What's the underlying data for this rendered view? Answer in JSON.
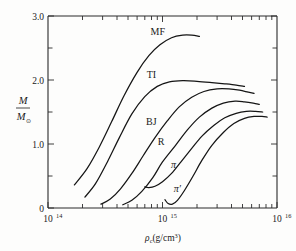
{
  "figure": {
    "name": "neutron-star-mass-vs-central-density",
    "background": "#fdfdfc",
    "ink": "#151515"
  },
  "axes": {
    "y": {
      "label_numerator": "M",
      "label_denominator": "M",
      "label_denominator_sub": "⊙",
      "label_plain": "M/M⊙",
      "major_ticks": [
        "3.0",
        "2.0",
        "1.0",
        "0"
      ],
      "major_values": [
        3.0,
        2.0,
        1.0,
        0.0
      ],
      "minor_values": [
        2.5,
        1.5,
        0.5
      ],
      "min": 0.0,
      "max": 3.0
    },
    "x": {
      "label": "ρc(g/cm3)",
      "label_base": "ρ",
      "label_sub": "c",
      "label_units_open": "(g/cm",
      "label_units_exp": "3",
      "label_units_close": ")",
      "tick_labels": [
        "10",
        "10",
        "10"
      ],
      "tick_exponents": [
        "14",
        "15",
        "16"
      ],
      "tick_values": [
        100000000000000.0,
        1000000000000000.0,
        1e+16
      ],
      "scale": "log",
      "min": 100000000000000.0,
      "max": 1e+16
    }
  },
  "curves": [
    {
      "name": "MF",
      "label": "MF"
    },
    {
      "name": "TI",
      "label": "TI"
    },
    {
      "name": "BJ",
      "label": "BJ"
    },
    {
      "name": "R",
      "label": "R"
    },
    {
      "name": "pi",
      "label": "π"
    },
    {
      "name": "pi-prime",
      "label": "π′"
    }
  ],
  "chart_data": {
    "type": "line",
    "title": "",
    "xlabel": "ρc(g/cm3)",
    "ylabel": "M/M⊙",
    "xscale": "log",
    "xlim": [
      100000000000000.0,
      1e+16
    ],
    "ylim": [
      0,
      3.0
    ],
    "grid": false,
    "legend": "inline-curve-labels",
    "yticks": [
      0,
      1.0,
      2.0,
      3.0
    ],
    "yticks_minor": [
      0.5,
      1.5,
      2.5
    ],
    "xticks": [
      100000000000000.0,
      1000000000000000.0,
      1e+16
    ],
    "series": [
      {
        "name": "MF",
        "label": "MF",
        "label_x": 910000000000000.0,
        "label_y": 2.7,
        "x": [
          170000000000000.0,
          220000000000000.0,
          280000000000000.0,
          360000000000000.0,
          460000000000000.0,
          600000000000000.0,
          760000000000000.0,
          950000000000000.0,
          1200000000000000.0,
          1500000000000000.0,
          1800000000000000.0,
          2100000000000000.0
        ],
        "y": [
          0.36,
          0.62,
          0.95,
          1.35,
          1.75,
          2.12,
          2.38,
          2.55,
          2.66,
          2.7,
          2.7,
          2.68
        ]
      },
      {
        "name": "TI",
        "label": "TI",
        "label_x": 800000000000000.0,
        "label_y": 2.03,
        "x": [
          210000000000000.0,
          260000000000000.0,
          330000000000000.0,
          420000000000000.0,
          540000000000000.0,
          700000000000000.0,
          900000000000000.0,
          1150000000000000.0,
          1500000000000000.0,
          2000000000000000.0,
          2700000000000000.0,
          3500000000000000.0,
          4400000000000000.0,
          5200000000000000.0
        ],
        "y": [
          0.17,
          0.38,
          0.72,
          1.1,
          1.47,
          1.74,
          1.9,
          1.97,
          1.99,
          1.98,
          1.96,
          1.94,
          1.92,
          1.9
        ]
      },
      {
        "name": "BJ",
        "label": "BJ",
        "label_x": 800000000000000.0,
        "label_y": 1.3,
        "x": [
          290000000000000.0,
          350000000000000.0,
          430000000000000.0,
          540000000000000.0,
          680000000000000.0,
          860000000000000.0,
          1100000000000000.0,
          1400000000000000.0,
          1800000000000000.0,
          2300000000000000.0,
          3000000000000000.0,
          3800000000000000.0,
          4700000000000000.0,
          5600000000000000.0,
          6300000000000000.0
        ],
        "y": [
          0.06,
          0.14,
          0.3,
          0.54,
          0.82,
          1.1,
          1.36,
          1.58,
          1.73,
          1.82,
          1.86,
          1.86,
          1.84,
          1.81,
          1.79
        ]
      },
      {
        "name": "R",
        "label": "R",
        "label_x": 970000000000000.0,
        "label_y": 0.98,
        "x": [
          450000000000000.0,
          540000000000000.0,
          660000000000000.0,
          820000000000000.0,
          1000000000000000.0,
          1300000000000000.0,
          1650000000000000.0,
          2100000000000000.0,
          2700000000000000.0,
          3400000000000000.0,
          4300000000000000.0,
          5200000000000000.0,
          6200000000000000.0,
          7000000000000000.0
        ],
        "y": [
          0.05,
          0.12,
          0.26,
          0.47,
          0.72,
          0.98,
          1.22,
          1.42,
          1.56,
          1.64,
          1.67,
          1.66,
          1.64,
          1.62
        ]
      },
      {
        "name": "pi",
        "label": "π",
        "label_x": 1250000000000000.0,
        "label_y": 0.62,
        "x": [
          700000000000000.0,
          760000000000000.0,
          860000000000000.0,
          1000000000000000.0,
          1200000000000000.0,
          1450000000000000.0,
          1800000000000000.0,
          2200000000000000.0,
          2800000000000000.0,
          3500000000000000.0,
          4400000000000000.0,
          5400000000000000.0,
          6500000000000000.0,
          7500000000000000.0
        ],
        "y": [
          0.33,
          0.32,
          0.34,
          0.41,
          0.54,
          0.72,
          0.93,
          1.12,
          1.29,
          1.41,
          1.48,
          1.51,
          1.51,
          1.5
        ]
      },
      {
        "name": "pi-prime",
        "label": "π′",
        "label_x": 1350000000000000.0,
        "label_y": 0.25,
        "x": [
          1050000000000000.0,
          1120000000000000.0,
          1220000000000000.0,
          1350000000000000.0,
          1550000000000000.0,
          1850000000000000.0,
          2200000000000000.0,
          2700000000000000.0,
          3400000000000000.0,
          4200000000000000.0,
          5200000000000000.0,
          6300000000000000.0,
          7400000000000000.0,
          8200000000000000.0
        ],
        "y": [
          0.13,
          0.07,
          0.06,
          0.12,
          0.27,
          0.5,
          0.74,
          0.98,
          1.18,
          1.32,
          1.4,
          1.43,
          1.43,
          1.42
        ]
      }
    ]
  }
}
